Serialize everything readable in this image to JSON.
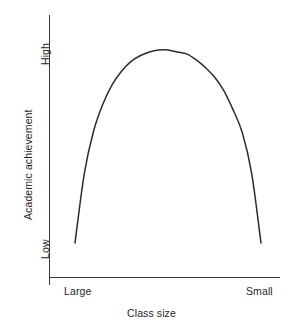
{
  "chart_data": {
    "type": "line",
    "title": "",
    "subtitle": "",
    "xlabel": "Class size",
    "ylabel": "Academic achievement",
    "x_tick_labels": [
      "Large",
      "Small"
    ],
    "y_tick_labels": [
      "High",
      "Low"
    ],
    "grid": false,
    "legend": "none",
    "annotations": [],
    "axis_color": "#3a3a3a",
    "curve_color": "#2c2c2c",
    "background_color": "#ffffff",
    "text_color": "#1f1f1f",
    "xlim": [
      "Large",
      "Small"
    ],
    "ylim": [
      "Low",
      "High"
    ],
    "series": [
      {
        "name": "Academic achievement vs class size",
        "shape": "inverted-parabola",
        "x": [
          0.0,
          0.05,
          0.1,
          0.15,
          0.2,
          0.25,
          0.3,
          0.35,
          0.4,
          0.45,
          0.5,
          0.55,
          0.6,
          0.65,
          0.7,
          0.75,
          0.8,
          0.85,
          0.9,
          0.95,
          1.0
        ],
        "y": [
          0.0,
          0.36,
          0.58,
          0.72,
          0.82,
          0.89,
          0.94,
          0.97,
          0.99,
          1.0,
          1.0,
          0.99,
          0.98,
          0.95,
          0.91,
          0.86,
          0.79,
          0.69,
          0.57,
          0.36,
          0.0
        ],
        "peak_x": 0.5,
        "peak_y": 1.0
      }
    ]
  },
  "geometry": {
    "y_axis": {
      "x": 49,
      "y_top": 15,
      "y_bottom": 277
    },
    "x_axis": {
      "y": 277,
      "x_left": 49,
      "x_right": 280
    },
    "origin_tick": {
      "x": 49,
      "y_top": 277,
      "y_bottom": 284
    },
    "curve_path": "M 75 243 C 75 150 110 52 169 50 C 228 52 261 150 261 243"
  }
}
